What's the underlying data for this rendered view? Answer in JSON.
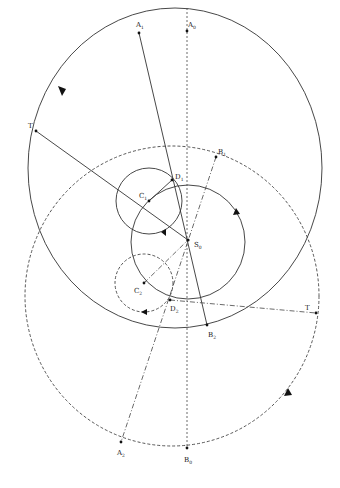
{
  "diagram": {
    "labels": {
      "A1": {
        "main": "A",
        "sub": "1"
      },
      "A0": {
        "main": "A",
        "sub": "0"
      },
      "A2": {
        "main": "A",
        "sub": "2"
      },
      "B1": {
        "main": "B",
        "sub": "1"
      },
      "B0": {
        "main": "B",
        "sub": "0"
      },
      "B2": {
        "main": "B",
        "sub": "2"
      },
      "C1": {
        "main": "C",
        "sub": "1"
      },
      "C2": {
        "main": "C",
        "sub": "2"
      },
      "D1": {
        "main": "D",
        "sub": "1"
      },
      "D2": {
        "main": "D",
        "sub": "2"
      },
      "S0": {
        "main": "S",
        "sub": "0"
      },
      "T_left": {
        "main": "T",
        "sub": ""
      },
      "T_right": {
        "main": "T",
        "sub": ""
      }
    },
    "points": {
      "A1": [
        139,
        33
      ],
      "A0": [
        187,
        35
      ],
      "A2": [
        121,
        442
      ],
      "B1": [
        216,
        157
      ],
      "B0": [
        187,
        448
      ],
      "B2": [
        207,
        325
      ],
      "C1": [
        149,
        201
      ],
      "C2": [
        144,
        283
      ],
      "D1": [
        172,
        180
      ],
      "D2": [
        170,
        300
      ],
      "S0": [
        188,
        240
      ],
      "T_left": [
        36,
        131
      ],
      "T_right": [
        316,
        313
      ]
    },
    "circles": [
      {
        "name": "deferent-solid",
        "cx": 175,
        "cy": 168,
        "rx": 147,
        "ry": 160,
        "style": "solid"
      },
      {
        "name": "deferent-dashed",
        "cx": 172,
        "cy": 296,
        "rx": 147,
        "ry": 150,
        "style": "dashed"
      },
      {
        "name": "sun-circle",
        "cx": 188,
        "cy": 242,
        "rx": 57,
        "ry": 57,
        "style": "solid"
      },
      {
        "name": "epicycle-1",
        "cx": 149,
        "cy": 201,
        "rx": 33,
        "ry": 33,
        "style": "solid"
      },
      {
        "name": "epicycle-2",
        "cx": 144,
        "cy": 283,
        "rx": 29,
        "ry": 29,
        "style": "dashed"
      }
    ]
  }
}
